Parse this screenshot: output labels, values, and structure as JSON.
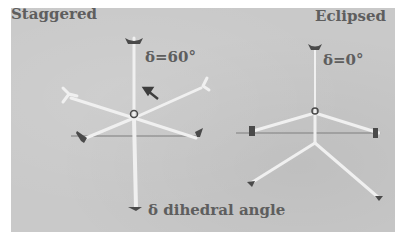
{
  "figure": {
    "left_panel": {
      "title": "Staggered",
      "angle_label": "δ=60°"
    },
    "right_panel": {
      "title": "Eclipsed",
      "angle_label": "δ=0°"
    },
    "caption": "δ dihedral angle",
    "colors": {
      "background": "#c9c9c9",
      "text": "#5e5e5e",
      "model_sticks": "#f2f2f2",
      "model_joints": "#4a4a4a",
      "page": "#ffffff"
    }
  }
}
